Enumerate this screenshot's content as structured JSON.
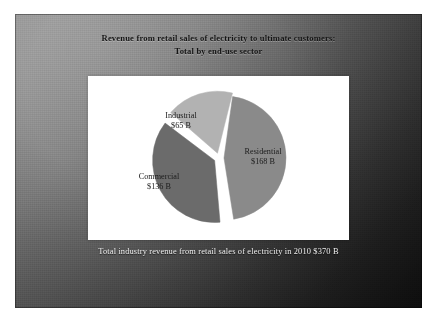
{
  "slide": {
    "title_line1": "Revenue from retail sales of electricity to ultimate customers:",
    "title_line2": "Total by end-use sector",
    "caption": "Total industry revenue from retail sales of electricity in 2010 $370 B",
    "title_color": "#151515",
    "caption_color": "#f0f0f0",
    "panel_color": "#ffffff",
    "background_light": "#9a9a9a",
    "background_dark": "#131313"
  },
  "chart_data": {
    "type": "pie",
    "title": "Revenue from retail sales of electricity to ultimate customers: Total by end-use sector",
    "categories": [
      "Residential",
      "Commercial",
      "Industrial"
    ],
    "values": [
      168,
      136,
      65
    ],
    "unit": "$ billion",
    "total": 370,
    "total_label": "$370 B",
    "exploded": true,
    "legend": "none",
    "labels_inside": true,
    "slices": [
      {
        "name": "Residential",
        "label": "Residential",
        "value_label": "$168 B",
        "value": 168,
        "percent": 45.4,
        "color": "#8a8a8a",
        "start_angle": 8,
        "sweep_angle": 163,
        "label_x": 175,
        "label_y": 78
      },
      {
        "name": "Commercial",
        "label": "Commercial",
        "value_label": "$136 B",
        "value": 136,
        "percent": 36.8,
        "color": "#6b6b6b",
        "start_angle": 175,
        "sweep_angle": 132,
        "label_x": 71,
        "label_y": 103
      },
      {
        "name": "Industrial",
        "label": "Industrial",
        "value_label": "$65 B",
        "value": 65,
        "percent": 17.6,
        "color": "#b2b2b2",
        "start_angle": 311,
        "sweep_angle": 63,
        "label_x": 93,
        "label_y": 42
      }
    ]
  }
}
